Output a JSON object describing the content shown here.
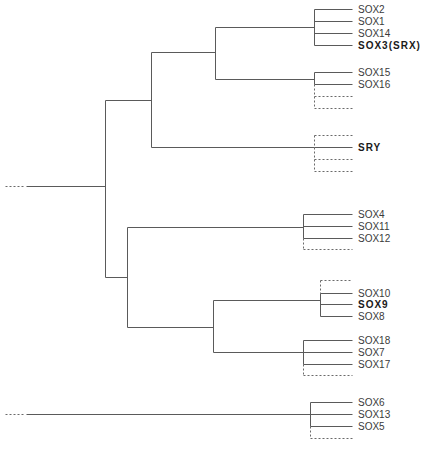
{
  "diagram": {
    "type": "phylogenetic-tree",
    "line_color": "#5a5a5a",
    "dashed_color": "#6a6a6a",
    "nodes": [
      {
        "id": "root",
        "x": 105,
        "y1": 100,
        "y2": 277,
        "stem": {
          "x1": 26,
          "x2": 105,
          "y": 186
        },
        "stem_dash": {
          "x1": 5,
          "x2": 24
        }
      },
      {
        "id": "n_upper",
        "x": 151,
        "y1": 52,
        "y2": 147,
        "stem": {
          "x1": 105,
          "x2": 151,
          "y": 100
        }
      },
      {
        "id": "n_sox_bc",
        "x": 215,
        "y1": 27,
        "y2": 79,
        "stem": {
          "x1": 151,
          "x2": 215,
          "y": 52
        }
      },
      {
        "id": "n_lower",
        "x": 127,
        "y1": 227,
        "y2": 327,
        "stem": {
          "x1": 105,
          "x2": 127,
          "y": 277
        }
      },
      {
        "id": "n_sox_ef",
        "x": 213,
        "y1": 300,
        "y2": 352,
        "stem": {
          "x1": 127,
          "x2": 213,
          "y": 327
        }
      }
    ],
    "clusters": [
      {
        "id": "soxb1",
        "x": 314,
        "stem": {
          "x1": 215,
          "y": 27
        },
        "leaves": [
          {
            "label": "SOX2",
            "y": 9,
            "bold": false
          },
          {
            "label": "SOX1",
            "y": 21,
            "bold": false
          },
          {
            "label": "SOX14",
            "y": 33,
            "bold": false
          },
          {
            "label": "SOX3(SRX)",
            "y": 45,
            "bold": true
          }
        ],
        "dashed": []
      },
      {
        "id": "soxg",
        "x": 314,
        "stem": {
          "x1": 215,
          "y": 79
        },
        "leaves": [
          {
            "label": "SOX15",
            "y": 72,
            "bold": false
          },
          {
            "label": "SOX16",
            "y": 84,
            "bold": false
          }
        ],
        "dashed": [
          96,
          108
        ]
      },
      {
        "id": "sry",
        "x": 314,
        "stem": {
          "x1": 151,
          "y": 147
        },
        "leaves": [
          {
            "label": "SRY",
            "y": 147,
            "bold": true
          }
        ],
        "dashed": [
          135,
          159,
          171
        ]
      },
      {
        "id": "soxc",
        "x": 303,
        "stem": {
          "x1": 127,
          "y": 227
        },
        "leaves": [
          {
            "label": "SOX4",
            "y": 214,
            "bold": false
          },
          {
            "label": "SOX11",
            "y": 226,
            "bold": false
          },
          {
            "label": "SOX12",
            "y": 238,
            "bold": false
          }
        ],
        "dashed": [
          249
        ]
      },
      {
        "id": "soxe",
        "x": 320,
        "stem": {
          "x1": 213,
          "y": 300
        },
        "leaves": [
          {
            "label": "SOX10",
            "y": 293,
            "bold": false
          },
          {
            "label": "SOX9",
            "y": 304,
            "bold": true
          },
          {
            "label": "SOX8",
            "y": 316,
            "bold": false
          }
        ],
        "dashed": [
          280
        ]
      },
      {
        "id": "soxf",
        "x": 303,
        "stem": {
          "x1": 213,
          "y": 352
        },
        "leaves": [
          {
            "label": "SOX18",
            "y": 340,
            "bold": false
          },
          {
            "label": "SOX7",
            "y": 352,
            "bold": false
          },
          {
            "label": "SOX17",
            "y": 364,
            "bold": false
          }
        ],
        "dashed": [
          375
        ]
      },
      {
        "id": "soxd",
        "x": 310,
        "stem": {
          "x1": 26,
          "y": 414
        },
        "stem_dash": {
          "x1": 5,
          "x2": 24
        },
        "leaves": [
          {
            "label": "SOX6",
            "y": 402,
            "bold": false
          },
          {
            "label": "SOX13",
            "y": 414,
            "bold": false
          },
          {
            "label": "SOX5",
            "y": 426,
            "bold": false
          }
        ],
        "dashed": [
          438
        ]
      }
    ],
    "leaf_end_x": 352,
    "label_x": 358
  }
}
